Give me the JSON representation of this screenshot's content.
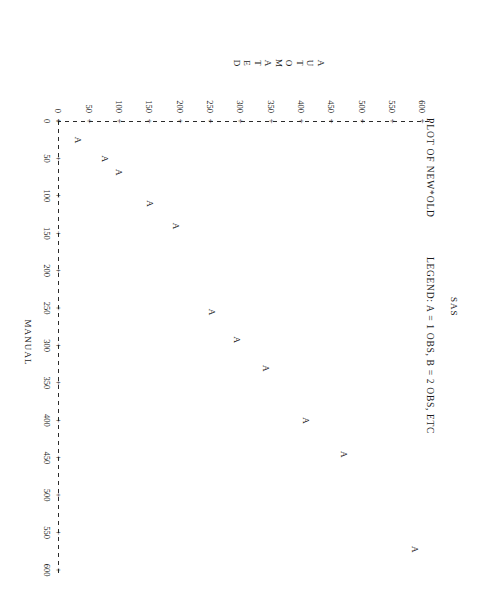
{
  "page": {
    "system_title": "SAS",
    "plot_title": "PLOT OF NEW*OLD",
    "legend": "LEGEND: A = 1 OBS, B = 2 OBS, ETC"
  },
  "chart_data": {
    "type": "scatter",
    "title": "PLOT OF NEW*OLD",
    "subtitle": "LEGEND: A = 1 OBS, B = 2 OBS, ETC",
    "xlabel": "MANUAL",
    "ylabel": "AUTOMATED",
    "ylabel_letters": [
      "A",
      "U",
      "T",
      "O",
      "M",
      "A",
      "T",
      "E",
      "D"
    ],
    "xlim": [
      0,
      600
    ],
    "ylim": [
      0,
      600
    ],
    "xticks": [
      0,
      50,
      100,
      150,
      200,
      250,
      300,
      350,
      400,
      450,
      500,
      550,
      600
    ],
    "yticks": [
      0,
      50,
      100,
      150,
      200,
      250,
      300,
      350,
      400,
      450,
      500,
      550,
      600
    ],
    "xticklabels": [
      "0",
      "50",
      "100",
      "150",
      "200",
      "250",
      "300",
      "350",
      "400",
      "450",
      "500",
      "550",
      "600"
    ],
    "yticklabels": [
      "0",
      "50",
      "100",
      "150",
      "200",
      "250",
      "300",
      "350",
      "400",
      "450",
      "500",
      "550",
      "600"
    ],
    "tick_glyph": "+",
    "grid": false,
    "legend_position": "none",
    "marker_symbol": "A",
    "series": [
      {
        "name": "NEW*OLD",
        "marker": "A",
        "points": [
          {
            "x": 25,
            "y": 30,
            "label": "A"
          },
          {
            "x": 50,
            "y": 75,
            "label": "A"
          },
          {
            "x": 68,
            "y": 98,
            "label": "A"
          },
          {
            "x": 110,
            "y": 148,
            "label": "A"
          },
          {
            "x": 140,
            "y": 192,
            "label": "A"
          },
          {
            "x": 255,
            "y": 250,
            "label": "A"
          },
          {
            "x": 292,
            "y": 292,
            "label": "A"
          },
          {
            "x": 330,
            "y": 340,
            "label": "A"
          },
          {
            "x": 400,
            "y": 405,
            "label": "A"
          },
          {
            "x": 445,
            "y": 468,
            "label": "A"
          },
          {
            "x": 572,
            "y": 585,
            "label": "A"
          }
        ]
      }
    ]
  }
}
